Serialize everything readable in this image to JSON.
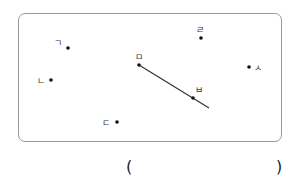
{
  "figure": {
    "points": [
      {
        "id": "g",
        "label": "ㄱ",
        "x": 68,
        "y": 48,
        "label_x": 54,
        "label_y": 46
      },
      {
        "id": "n",
        "label": "ㄴ",
        "x": 51,
        "y": 80,
        "label_x": 37,
        "label_y": 84
      },
      {
        "id": "d",
        "label": "ㄷ",
        "x": 117,
        "y": 122,
        "label_x": 102,
        "label_y": 126
      },
      {
        "id": "r",
        "label": "ㄹ",
        "x": 201,
        "y": 38,
        "label_x": 196,
        "label_y": 33
      },
      {
        "id": "m",
        "label": "ㅁ",
        "x": 139,
        "y": 65,
        "label_x": 135,
        "label_y": 60
      },
      {
        "id": "b",
        "label": "ㅂ",
        "x": 193,
        "y": 98,
        "label_x": 195,
        "label_y": 93
      },
      {
        "id": "s",
        "label": "ㅅ",
        "x": 249,
        "y": 67,
        "label_x": 254,
        "label_y": 71
      }
    ],
    "ray": {
      "from": "ㅁ",
      "through": "ㅂ",
      "x1": 139,
      "y1": 65,
      "x2": 209,
      "y2": 108
    },
    "colors": {
      "border": "#9a9a9a",
      "point": "#111111",
      "line": "#333333"
    }
  },
  "answer": {
    "open_paren": "(",
    "close_paren": ")",
    "value": ""
  }
}
